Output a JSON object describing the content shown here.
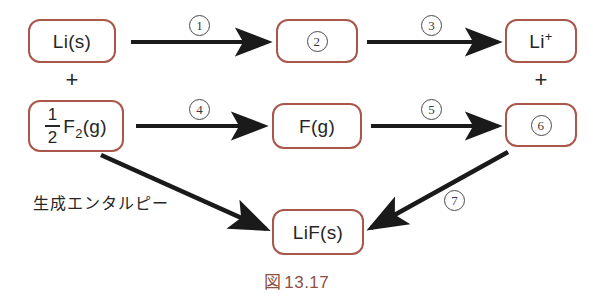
{
  "figure": {
    "caption_symbol": "図",
    "caption_number": "13.17",
    "annotation_label": "生成エンタルピー",
    "border_color": "#a8574a",
    "arrow_color": "#1a1a1a",
    "caption_color": "#8d5043"
  },
  "boxes": {
    "reactant_metal": {
      "text": "Li(s)"
    },
    "step2_box": {
      "text": "②"
    },
    "cation": {
      "element": "Li",
      "charge": "+"
    },
    "reactant_halogen": {
      "coefficient_numerator": "1",
      "coefficient_denominator": "2",
      "formula": "F",
      "subscript": "2",
      "state": "(g)"
    },
    "atomic_halogen": {
      "text": "F(g)"
    },
    "step6_box": {
      "text": "⑥"
    },
    "product": {
      "text": "LiF(s)"
    }
  },
  "operators": {
    "left_plus": "+",
    "right_plus": "+"
  },
  "steps": [
    {
      "id": "1",
      "label": "①",
      "from": "Li(s)",
      "to": "②"
    },
    {
      "id": "3",
      "label": "③",
      "from": "②",
      "to": "Li+"
    },
    {
      "id": "4",
      "label": "④",
      "from": "1/2 F2(g)",
      "to": "F(g)"
    },
    {
      "id": "5",
      "label": "⑤",
      "from": "F(g)",
      "to": "⑥"
    },
    {
      "id": "7",
      "label": "⑦",
      "from": "⑥",
      "to": "LiF(s)"
    }
  ],
  "arrow_labels": {
    "s1": "1",
    "s3": "3",
    "s4": "4",
    "s5": "5",
    "s7": "7",
    "s2": "2",
    "s6": "6"
  }
}
